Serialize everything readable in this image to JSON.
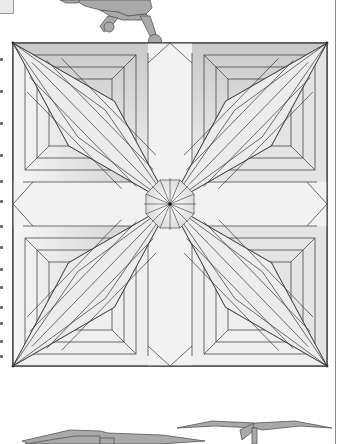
{
  "page": {
    "kind": "origami crease pattern diagram",
    "background": "#ffffff"
  },
  "colors": {
    "line": "#333333",
    "paper_light": "#f4f4f4",
    "paper_mid": "#d6d6d6",
    "paper_dark": "#b8b8b8",
    "model_fill": "#a9a9a9",
    "model_stroke": "#555555"
  },
  "crease_pattern": {
    "square": {
      "x0": 13,
      "y0": 43,
      "x1": 327,
      "y1": 366
    },
    "center": {
      "x": 170,
      "y": 204
    },
    "edge_notch_depth": 10,
    "center_star_radius": 26,
    "ring_insets": [
      12,
      24,
      36
    ],
    "diagonal_strip_offsets": [
      -24,
      -12,
      0,
      12,
      24
    ]
  },
  "margin_glyph_ys": [
    8,
    40,
    72,
    104,
    130,
    150,
    175,
    196,
    218,
    236,
    256,
    272,
    290,
    305
  ],
  "illustrations": {
    "top_model": "robot-figure-legs",
    "bottom_models": [
      "folded-model-left",
      "folded-model-right"
    ]
  }
}
